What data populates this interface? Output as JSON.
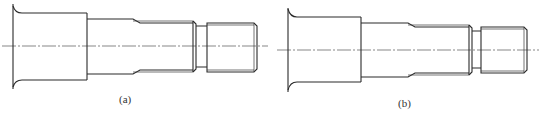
{
  "figure": {
    "panels": [
      {
        "id": "a",
        "caption": "(a)",
        "description": "Stepped shaft with flared flange, tapered transition and threaded end"
      },
      {
        "id": "b",
        "caption": "(b)",
        "description": "Stepped shaft with flared flange, tapered transition and threaded end (variant)"
      }
    ],
    "line_color": "#2a2a2a",
    "centerline_color": "#555555"
  }
}
